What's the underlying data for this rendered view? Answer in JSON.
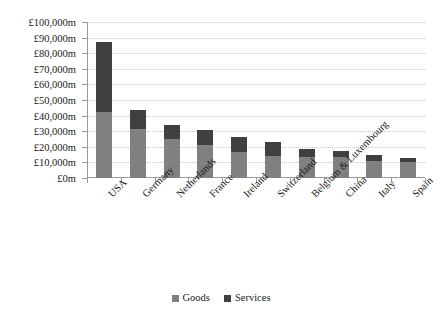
{
  "chart_data": {
    "type": "bar",
    "subtype": "stacked-vertical",
    "title": "",
    "xlabel": "",
    "ylabel": "",
    "ylim": [
      0,
      100000
    ],
    "y_tick_step": 10000,
    "y_tick_labels": [
      "£100,000m",
      "£90,000m",
      "£80,000m",
      "£70,000m",
      "£60,000m",
      "£50,000m",
      "£40,000m",
      "£30,000m",
      "£20,000m",
      "£10,000m",
      "£0m"
    ],
    "y_tick_values": [
      100000,
      90000,
      80000,
      70000,
      60000,
      50000,
      40000,
      30000,
      20000,
      10000,
      0
    ],
    "grid": true,
    "grid_style": "dotted-horizontal",
    "legend_position": "bottom-center",
    "units": "£ millions",
    "categories": [
      "USA",
      "Germany",
      "Netherlands",
      "France",
      "Ireland",
      "Switzerland",
      "Belgium & Luxembourg",
      "China",
      "Italy",
      "Spain"
    ],
    "series": [
      {
        "name": "Goods",
        "color": "#808080",
        "values": [
          42000,
          31500,
          25000,
          21000,
          16500,
          14000,
          13500,
          13500,
          11000,
          10000
        ]
      },
      {
        "name": "Services",
        "color": "#404040",
        "values": [
          45000,
          12000,
          9000,
          10000,
          10000,
          9000,
          5000,
          4000,
          3500,
          3000
        ]
      }
    ],
    "totals": [
      87000,
      43500,
      34000,
      31000,
      26500,
      23000,
      18500,
      17500,
      14500,
      13000
    ]
  },
  "legend": {
    "items": [
      {
        "label": "Goods",
        "color": "#808080"
      },
      {
        "label": "Services",
        "color": "#404040"
      }
    ]
  },
  "colors": {
    "goods": "#808080",
    "services": "#404040",
    "axis": "#9a9a9a",
    "grid": "#c8c8c8",
    "background": "#ffffff",
    "text": "#1a1a1a"
  }
}
